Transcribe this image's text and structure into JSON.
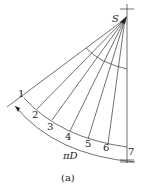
{
  "diagram": {
    "apex_label": "S",
    "point_labels": [
      "1",
      "2",
      "3",
      "4",
      "5",
      "6",
      "7"
    ],
    "arc_label": "πD",
    "caption": "(a)",
    "line_color": "#333333"
  }
}
